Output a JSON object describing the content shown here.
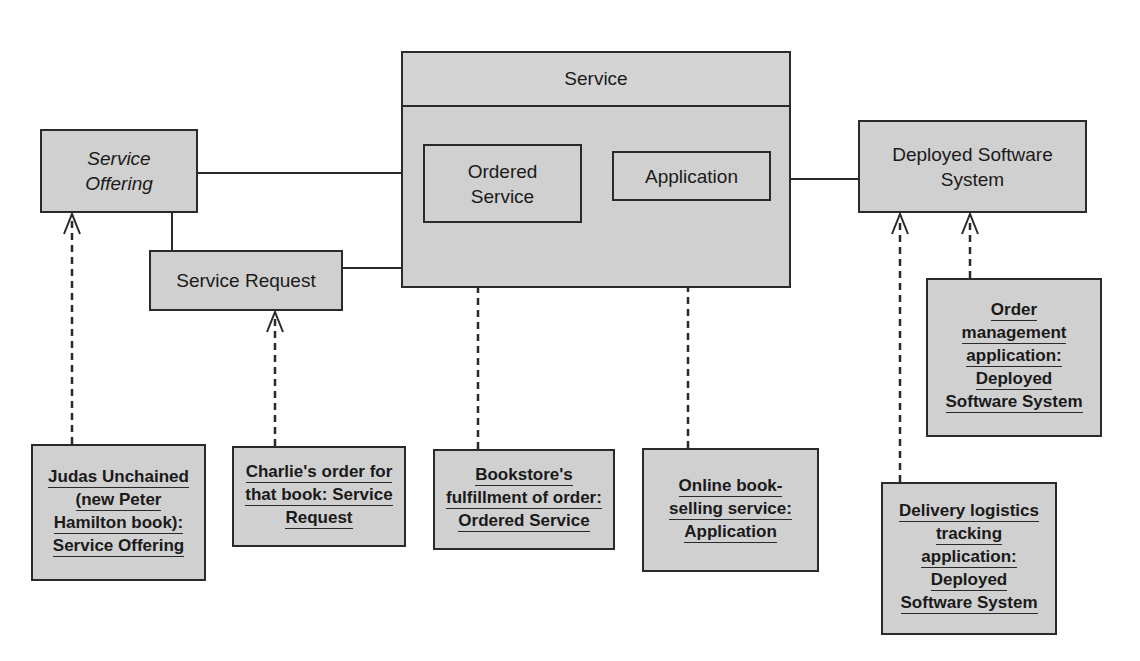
{
  "diagram": {
    "classes": {
      "service_offering": "Service Offering",
      "service_offering_line1": "Service",
      "service_offering_line2": "Offering",
      "service_request": "Service Request",
      "service": "Service",
      "ordered_service_line1": "Ordered",
      "ordered_service_line2": "Service",
      "application": "Application",
      "deployed_line1": "Deployed Software",
      "deployed_line2": "System"
    },
    "instances": {
      "judas": [
        "Judas Unchained",
        "(new Peter",
        "Hamilton book):",
        "Service Offering"
      ],
      "charlie": [
        "Charlie's order for",
        "that book: Service",
        "Request"
      ],
      "bookstore": [
        "Bookstore's",
        "fulfillment of order:",
        "Ordered Service"
      ],
      "online": [
        "Online book-",
        "selling service:",
        "Application"
      ],
      "order_mgmt": [
        "Order",
        "management",
        "application:",
        "Deployed",
        "Software System"
      ],
      "delivery": [
        "Delivery logistics",
        "tracking",
        "application:",
        "Deployed",
        "Software System"
      ]
    },
    "colors": {
      "box_fill": "#d0d0d0",
      "stroke": "#2a2a2a",
      "background": "#ffffff"
    }
  }
}
